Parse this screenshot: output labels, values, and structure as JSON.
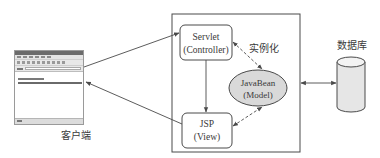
{
  "diagram": {
    "type": "MVC architecture (JSP Model 2)",
    "client": {
      "label": "客户端",
      "browser_window": {
        "content_lines": 2
      }
    },
    "server_container": {
      "components": {
        "controller": {
          "line1": "Servlet",
          "line2": "(Controller)"
        },
        "view": {
          "line1": "JSP",
          "line2": "(View)"
        },
        "model": {
          "line1": "JavaBean",
          "line2": "(Model)"
        }
      },
      "instantiate_label": "实例化"
    },
    "database": {
      "label": "数据库"
    },
    "edges": [
      {
        "from": "client",
        "to": "controller",
        "style": "solid",
        "arrow": "end"
      },
      {
        "from": "view",
        "to": "client",
        "style": "solid",
        "arrow": "end"
      },
      {
        "from": "controller",
        "to": "view",
        "style": "solid",
        "arrow": "end"
      },
      {
        "from": "controller",
        "to": "model",
        "style": "dashed",
        "arrow": "both",
        "label": "实例化"
      },
      {
        "from": "view",
        "to": "model",
        "style": "dashed",
        "arrow": "both"
      },
      {
        "from": "server_container",
        "to": "database",
        "style": "solid",
        "arrow": "both"
      }
    ],
    "colors": {
      "stroke": "#4a4a4a",
      "model_fill": "#d9d9d9",
      "database_fill": "#e6e6e6",
      "text": "#3a3a3a"
    }
  }
}
